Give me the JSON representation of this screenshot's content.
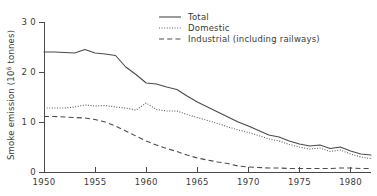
{
  "chart_data": {
    "type": "line",
    "title": "",
    "xlabel": "",
    "ylabel": "Smoke emission (10⁶ tonnes)",
    "ylabel_main": "Smoke emission (10",
    "ylabel_exp": "6",
    "ylabel_tail": " tonnes)",
    "xlim": [
      1950,
      1982
    ],
    "ylim": [
      0,
      3.0
    ],
    "grid": false,
    "legend_position": "top-center",
    "x_ticks": [
      1950,
      1955,
      1960,
      1965,
      1970,
      1975,
      1980
    ],
    "x_tick_labels": [
      "1950",
      "1955",
      "1960",
      "1965",
      "1970",
      "1975",
      "1980"
    ],
    "y_ticks": [
      0,
      1.0,
      2.0,
      3.0
    ],
    "y_tick_labels": [
      "0",
      "1 0",
      "2 0",
      "3 0"
    ],
    "x": [
      1950,
      1951,
      1952,
      1953,
      1954,
      1955,
      1956,
      1957,
      1958,
      1959,
      1960,
      1961,
      1962,
      1963,
      1964,
      1965,
      1966,
      1967,
      1968,
      1969,
      1970,
      1971,
      1972,
      1973,
      1974,
      1975,
      1976,
      1977,
      1978,
      1979,
      1980,
      1981,
      1982
    ],
    "series": [
      {
        "name": "Total",
        "style": "solid",
        "color": "#4a4a4a",
        "values": [
          2.4,
          2.4,
          2.39,
          2.38,
          2.45,
          2.38,
          2.36,
          2.33,
          2.1,
          1.95,
          1.78,
          1.76,
          1.7,
          1.65,
          1.52,
          1.4,
          1.3,
          1.2,
          1.1,
          1.0,
          0.92,
          0.83,
          0.74,
          0.7,
          0.62,
          0.56,
          0.52,
          0.54,
          0.47,
          0.5,
          0.42,
          0.36,
          0.34
        ]
      },
      {
        "name": "Domestic",
        "style": "dotted",
        "color": "#5a5a5a",
        "values": [
          1.28,
          1.28,
          1.28,
          1.3,
          1.34,
          1.32,
          1.33,
          1.3,
          1.28,
          1.24,
          1.38,
          1.25,
          1.22,
          1.22,
          1.15,
          1.09,
          1.03,
          0.97,
          0.9,
          0.84,
          0.79,
          0.73,
          0.66,
          0.62,
          0.55,
          0.5,
          0.46,
          0.48,
          0.41,
          0.44,
          0.36,
          0.3,
          0.27
        ]
      },
      {
        "name": "Industrial (including railways)",
        "style": "dashed",
        "color": "#4a4a4a",
        "values": [
          1.11,
          1.11,
          1.1,
          1.09,
          1.08,
          1.05,
          1.0,
          0.92,
          0.82,
          0.72,
          0.62,
          0.54,
          0.47,
          0.41,
          0.34,
          0.28,
          0.24,
          0.2,
          0.17,
          0.12,
          0.1,
          0.09,
          0.08,
          0.08,
          0.07,
          0.07,
          0.07,
          0.07,
          0.07,
          0.08,
          0.08,
          0.07,
          0.07
        ]
      }
    ],
    "legend": [
      {
        "label": "Total",
        "style": "solid"
      },
      {
        "label": "Domestic",
        "style": "dotted"
      },
      {
        "label": "Industrial (including railways)",
        "style": "dashed"
      }
    ]
  }
}
